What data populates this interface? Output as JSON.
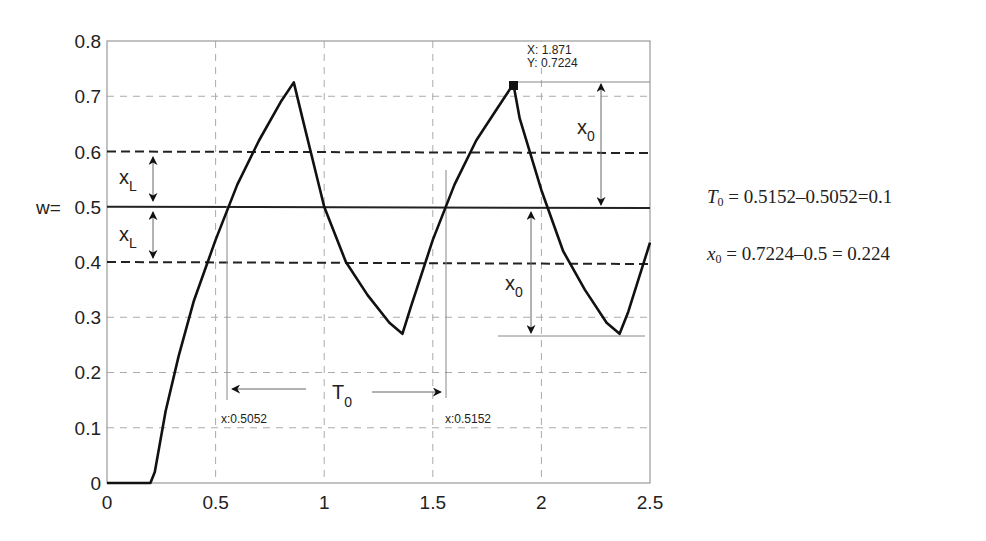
{
  "chart_data": {
    "type": "line",
    "title": "",
    "xlabel": "",
    "ylabel": "w",
    "xlim": [
      0,
      2.5
    ],
    "ylim": [
      0,
      0.8
    ],
    "grid": true,
    "x_ticks": [
      "0",
      "0.5",
      "1",
      "1.5",
      "2",
      "2.5"
    ],
    "y_ticks": [
      "0",
      "0.1",
      "0.2",
      "0.3",
      "0.4",
      "0.5",
      "0.6",
      "0.7",
      "0.8"
    ],
    "y_tick_prefix_at_0_5": "w=",
    "series": [
      {
        "name": "response",
        "x": [
          0,
          0.2,
          0.22,
          0.27,
          0.33,
          0.4,
          0.5,
          0.6,
          0.7,
          0.8,
          0.86,
          0.9,
          1.0,
          1.1,
          1.2,
          1.3,
          1.36,
          1.4,
          1.5,
          1.6,
          1.7,
          1.8,
          1.871,
          1.9,
          2.0,
          2.1,
          2.2,
          2.3,
          2.36,
          2.4,
          2.5
        ],
        "y": [
          0,
          0,
          0.02,
          0.13,
          0.23,
          0.33,
          0.44,
          0.54,
          0.62,
          0.69,
          0.725,
          0.66,
          0.5,
          0.4,
          0.34,
          0.29,
          0.27,
          0.32,
          0.44,
          0.54,
          0.62,
          0.68,
          0.7224,
          0.66,
          0.53,
          0.42,
          0.35,
          0.29,
          0.27,
          0.31,
          0.435
        ]
      }
    ],
    "reference_lines": [
      {
        "type": "horizontal",
        "y": 0.5,
        "style": "solid",
        "label": "w="
      },
      {
        "type": "horizontal",
        "y": 0.6,
        "style": "dashed"
      },
      {
        "type": "horizontal",
        "y": 0.4,
        "style": "dashed"
      }
    ],
    "annotations": {
      "datatip": {
        "x_label": "X: 1.871",
        "y_label": "Y: 0.7224",
        "x": 1.871,
        "y": 0.7224
      },
      "t0_label": "T",
      "t0_sub": "0",
      "t0_left_tip": "x:0.5052",
      "t0_right_tip": "x:0.5152",
      "xl_label": "x",
      "xl_sub": "L",
      "x0_label": "x",
      "x0_sub": "0"
    }
  },
  "equations": {
    "t0": {
      "lhs": "T",
      "sub": "0",
      "rhs": " = 0.5152–0.5052=0.1"
    },
    "x0": {
      "lhs": "x",
      "sub": "0",
      "rhs": " = 0.7224–0.5 = 0.224"
    }
  }
}
